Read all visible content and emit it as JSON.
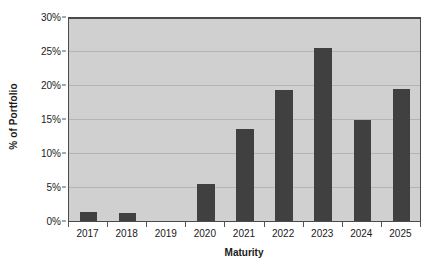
{
  "chart_data": {
    "type": "bar",
    "title": "",
    "subtitle": "",
    "xlabel": "Maturity",
    "ylabel": "% of Portfolio",
    "categories": [
      "2017",
      "2018",
      "2019",
      "2020",
      "2021",
      "2022",
      "2023",
      "2024",
      "2025"
    ],
    "values": [
      1.3,
      1.2,
      0,
      5.4,
      13.6,
      19.3,
      25.4,
      14.8,
      19.4
    ],
    "series": [
      {
        "name": "% of Portfolio",
        "values": [
          1.3,
          1.2,
          0,
          5.4,
          13.6,
          19.3,
          25.4,
          14.8,
          19.4
        ]
      }
    ],
    "ylim": [
      0,
      30
    ],
    "ytick_values": [
      0,
      5,
      10,
      15,
      20,
      25,
      30
    ],
    "ytick_labels": [
      "0%",
      "5%",
      "10%",
      "15%",
      "20%",
      "25%",
      "30%"
    ],
    "grid": "horizontal",
    "legend": "none",
    "annotations": [],
    "colors": {
      "bar": "#404040",
      "plot_background": "#d0d0d0",
      "page_background": "#ffffff",
      "gridline": "#b4b4b4",
      "axis_line": "#4a4a4a",
      "text": "#1a1a1a"
    }
  }
}
